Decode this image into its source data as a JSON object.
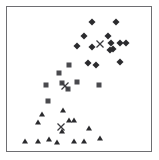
{
  "chart_data": {
    "type": "scatter",
    "title": "",
    "subtitle": "",
    "xlabel": "",
    "ylabel": "",
    "xlim": [
      0,
      159
    ],
    "ylim": [
      0,
      160
    ],
    "grid": false,
    "legend": "none",
    "axis_ticks": [],
    "frame": {
      "left": 6,
      "top": 6,
      "width": 146,
      "height": 146,
      "border_color": "#6e6e72",
      "background": "#ffffff"
    },
    "colors": {
      "diamond": "#2b2b2e",
      "square": "#4a4a4e",
      "triangle": "#2b2b2e",
      "centroid": "#3a3a3e",
      "frame": "#6e6e72",
      "background": "#ffffff"
    },
    "series": [
      {
        "name": "Cluster 1",
        "marker": "diamond",
        "color": "#2b2b2e",
        "points": [
          [
            92,
            22
          ],
          [
            116,
            22
          ],
          [
            84,
            36
          ],
          [
            108,
            36
          ],
          [
            77,
            46
          ],
          [
            92,
            47
          ],
          [
            111,
            43
          ],
          [
            120,
            43
          ],
          [
            126,
            43
          ],
          [
            113,
            49
          ],
          [
            110,
            50
          ],
          [
            88,
            63
          ],
          [
            96,
            65
          ],
          [
            120,
            62
          ]
        ]
      },
      {
        "name": "Cluster 2",
        "marker": "square",
        "color": "#4a4a4e",
        "points": [
          [
            69,
            65
          ],
          [
            59,
            73
          ],
          [
            46,
            85
          ],
          [
            62,
            83
          ],
          [
            77,
            82
          ],
          [
            68,
            89
          ],
          [
            99,
            85
          ],
          [
            48,
            101
          ]
        ]
      },
      {
        "name": "Cluster 3",
        "marker": "triangle",
        "color": "#2b2b2e",
        "points": [
          [
            63,
            110
          ],
          [
            42,
            114
          ],
          [
            38,
            122
          ],
          [
            69,
            120
          ],
          [
            74,
            120
          ],
          [
            62,
            131
          ],
          [
            89,
            128
          ],
          [
            25,
            141
          ],
          [
            38,
            141
          ],
          [
            49,
            139
          ],
          [
            57,
            142
          ],
          [
            74,
            141
          ],
          [
            84,
            141
          ],
          [
            100,
            138
          ]
        ]
      },
      {
        "name": "Centroids",
        "marker": "x",
        "color": "#3a3a3e",
        "points": [
          [
            100,
            44
          ],
          [
            65,
            86
          ],
          [
            61,
            127
          ]
        ]
      }
    ]
  }
}
